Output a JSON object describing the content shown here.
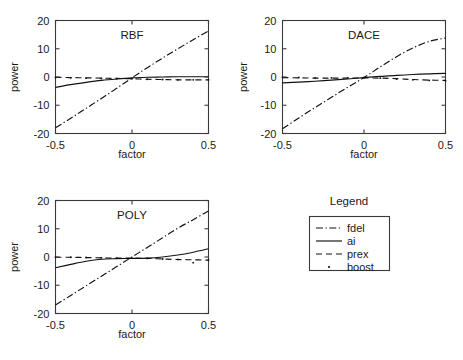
{
  "figure": {
    "background": "#ffffff",
    "line_color": "#111111",
    "axis_color": "#3a3a3a"
  },
  "legend": {
    "title": "Legend",
    "entries": [
      {
        "label": "fdel",
        "style": "dashdot"
      },
      {
        "label": "ai",
        "style": "solid"
      },
      {
        "label": "prex",
        "style": "dashed"
      },
      {
        "label": "boost",
        "style": "dotted"
      }
    ]
  },
  "chart_data": [
    {
      "type": "line",
      "title": "RBF",
      "xlabel": "factor",
      "ylabel": "power",
      "xlim": [
        -0.5,
        0.5
      ],
      "ylim": [
        -20,
        20
      ],
      "xticks": [
        -0.5,
        0,
        0.5
      ],
      "xticklabels": [
        "-0.5",
        "0",
        "0.5"
      ],
      "yticks": [
        -20,
        -10,
        0,
        10,
        20
      ],
      "yticklabels": [
        "-20",
        "-10",
        "0",
        "10",
        "20"
      ],
      "grid": false,
      "x": [
        -0.5,
        -0.4,
        -0.3,
        -0.2,
        -0.1,
        0,
        0.1,
        0.2,
        0.3,
        0.4,
        0.5
      ],
      "series": [
        {
          "name": "fdel",
          "style": "dashdot",
          "values": [
            -18.0,
            -14.6,
            -11.1,
            -7.6,
            -4.0,
            -0.3,
            3.3,
            6.7,
            10.0,
            13.2,
            16.3
          ]
        },
        {
          "name": "ai",
          "style": "solid",
          "values": [
            -3.7,
            -2.7,
            -1.9,
            -1.2,
            -0.7,
            -0.3,
            -0.1,
            0.0,
            0.1,
            0.1,
            0.1
          ]
        },
        {
          "name": "prex",
          "style": "dashed",
          "values": [
            -0.1,
            -0.2,
            -0.3,
            -0.4,
            -0.5,
            -0.6,
            -0.8,
            -0.9,
            -1.0,
            -1.0,
            -1.0
          ]
        },
        {
          "name": "boost",
          "style": "dotted",
          "values": [
            -0.2,
            -0.3,
            -0.4,
            -0.5,
            -0.6,
            -0.6,
            -0.8,
            -0.9,
            -1.0,
            -1.0,
            -1.0
          ]
        }
      ]
    },
    {
      "type": "line",
      "title": "DACE",
      "xlabel": "factor",
      "ylabel": "power",
      "xlim": [
        -0.5,
        0.5
      ],
      "ylim": [
        -20,
        20
      ],
      "xticks": [
        -0.5,
        0,
        0.5
      ],
      "xticklabels": [
        "-0.5",
        "0",
        "0.5"
      ],
      "yticks": [
        -20,
        -10,
        0,
        10,
        20
      ],
      "yticklabels": [
        "-20",
        "-10",
        "0",
        "10",
        "20"
      ],
      "grid": false,
      "x": [
        -0.5,
        -0.4,
        -0.3,
        -0.2,
        -0.1,
        0,
        0.1,
        0.2,
        0.3,
        0.4,
        0.5
      ],
      "series": [
        {
          "name": "fdel",
          "style": "dashdot",
          "values": [
            -18.3,
            -14.5,
            -10.8,
            -7.2,
            -3.6,
            -0.2,
            3.6,
            7.2,
            10.3,
            12.6,
            13.8
          ]
        },
        {
          "name": "ai",
          "style": "solid",
          "values": [
            -2.1,
            -1.8,
            -1.5,
            -1.1,
            -0.7,
            -0.2,
            0.2,
            0.6,
            0.9,
            1.1,
            1.3
          ]
        },
        {
          "name": "prex",
          "style": "dashed",
          "values": [
            -0.2,
            -0.3,
            -0.4,
            -0.4,
            -0.4,
            -0.3,
            -0.4,
            -0.6,
            -0.9,
            -1.1,
            -1.2
          ]
        },
        {
          "name": "boost",
          "style": "dotted",
          "values": [
            -0.1,
            -0.2,
            -0.3,
            -0.3,
            -0.3,
            -0.2,
            -0.4,
            -0.7,
            -1.0,
            -1.2,
            -1.3
          ]
        }
      ]
    },
    {
      "type": "line",
      "title": "POLY",
      "xlabel": "factor",
      "ylabel": "power",
      "xlim": [
        -0.5,
        0.5
      ],
      "ylim": [
        -20,
        20
      ],
      "xticks": [
        -0.5,
        0,
        0.5
      ],
      "xticklabels": [
        "-0.5",
        "0",
        "0.5"
      ],
      "yticks": [
        -20,
        -10,
        0,
        10,
        20
      ],
      "yticklabels": [
        "-20",
        "-10",
        "0",
        "10",
        "20"
      ],
      "grid": false,
      "x": [
        -0.5,
        -0.4,
        -0.3,
        -0.2,
        -0.1,
        0,
        0.1,
        0.2,
        0.3,
        0.4,
        0.5
      ],
      "values_note": "",
      "series": [
        {
          "name": "fdel",
          "style": "dashdot",
          "values": [
            -17.0,
            -13.6,
            -10.2,
            -6.8,
            -3.4,
            0.0,
            3.4,
            6.8,
            10.2,
            13.2,
            16.3
          ]
        },
        {
          "name": "ai",
          "style": "solid",
          "values": [
            -3.8,
            -2.6,
            -1.5,
            -0.8,
            -0.6,
            -0.5,
            -0.4,
            0.0,
            0.7,
            1.7,
            2.9
          ]
        },
        {
          "name": "prex",
          "style": "dashed",
          "values": [
            -0.1,
            -0.1,
            -0.2,
            -0.3,
            -0.4,
            -0.4,
            -0.5,
            -0.7,
            -0.9,
            -1.0,
            -1.1
          ]
        },
        {
          "name": "boost",
          "style": "dotted",
          "values": [
            -0.1,
            -0.1,
            -0.2,
            -0.3,
            -0.4,
            -0.4,
            -0.5,
            -0.7,
            -0.9,
            -2.0,
            -1.1
          ]
        }
      ]
    }
  ]
}
